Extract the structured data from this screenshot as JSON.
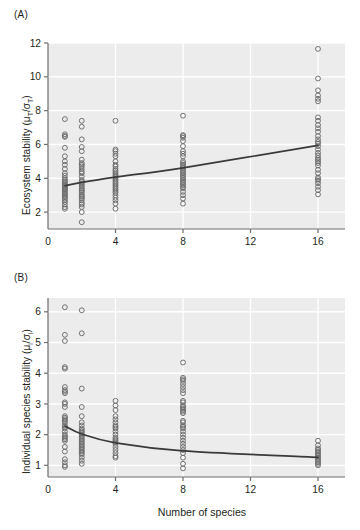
{
  "figure": {
    "width": 360,
    "height": 530,
    "background": "#ffffff",
    "plot_background": "#ececec",
    "gridline_color": "#ffffff",
    "axis_color": "#6e6e6e",
    "point_color": "#6b6b6b",
    "trend_color": "#3a3a3a"
  },
  "panels": {
    "a": {
      "label": "(A)",
      "ylabel_text": "Ecosystem stability (μT/σT)",
      "ylabel_main": "Ecosystem stability (μ",
      "ylabel_sub1": "T",
      "ylabel_mid": "/σ",
      "ylabel_sub2": "T",
      "ylabel_end": ")"
    },
    "b": {
      "label": "(B)",
      "ylabel_text": "Individual species stability (μi/σi)",
      "ylabel_main": "Individual species stability (μ",
      "ylabel_sub1": "i",
      "ylabel_mid": "/σ",
      "ylabel_sub2": "i",
      "ylabel_end": ")",
      "xlabel": "Number of species"
    }
  },
  "chart_data": [
    {
      "panel": "(A)",
      "type": "scatter",
      "title": "",
      "xlabel": "",
      "ylabel": "Ecosystem stability (μT/σT)",
      "xlim": [
        0,
        17.6
      ],
      "ylim": [
        1.0,
        12.0
      ],
      "xticks": [
        0,
        4,
        8,
        12,
        16
      ],
      "xticklabels": [
        "0",
        "4",
        "8",
        "12",
        "16"
      ],
      "yticks": [
        2,
        4,
        6,
        8,
        10,
        12
      ],
      "yticklabels": [
        "2",
        "4",
        "6",
        "8",
        "10",
        "12"
      ],
      "grid": true,
      "legend": "none",
      "series": [
        {
          "name": "observations",
          "marker": "open-circle",
          "x": [
            1,
            1,
            1,
            1,
            1,
            1,
            1,
            1,
            1,
            1,
            1,
            1,
            1,
            1,
            1,
            1,
            1,
            1,
            1,
            1,
            1,
            1,
            1,
            1,
            1,
            1,
            1,
            1,
            1,
            1,
            1,
            1,
            2,
            2,
            2,
            2,
            2,
            2,
            2,
            2,
            2,
            2,
            2,
            2,
            2,
            2,
            2,
            2,
            2,
            2,
            2,
            2,
            2,
            2,
            2,
            2,
            2,
            2,
            2,
            2,
            2,
            2,
            2,
            2,
            4,
            4,
            4,
            4,
            4,
            4,
            4,
            4,
            4,
            4,
            4,
            4,
            4,
            4,
            4,
            4,
            4,
            4,
            4,
            4,
            4,
            4,
            4,
            4,
            4,
            4,
            4,
            4,
            8,
            8,
            8,
            8,
            8,
            8,
            8,
            8,
            8,
            8,
            8,
            8,
            8,
            8,
            8,
            8,
            8,
            8,
            8,
            8,
            8,
            8,
            8,
            8,
            8,
            8,
            8,
            8,
            8,
            8,
            16,
            16,
            16,
            16,
            16,
            16,
            16,
            16,
            16,
            16,
            16,
            16,
            16,
            16,
            16,
            16,
            16,
            16,
            16,
            16,
            16,
            16,
            16,
            16,
            16,
            16,
            16,
            16,
            16,
            16,
            16,
            16,
            16
          ],
          "y": [
            7.5,
            6.6,
            6.5,
            6.45,
            5.8,
            5.3,
            5.0,
            4.8,
            4.55,
            4.3,
            4.15,
            4.0,
            3.9,
            3.8,
            3.7,
            3.62,
            3.55,
            3.5,
            3.42,
            3.35,
            3.3,
            3.2,
            3.12,
            3.05,
            2.95,
            2.9,
            2.8,
            2.7,
            2.6,
            2.45,
            2.3,
            2.2,
            7.4,
            7.05,
            6.3,
            5.85,
            5.6,
            5.1,
            4.9,
            4.8,
            4.7,
            4.55,
            4.4,
            4.3,
            4.1,
            3.9,
            3.8,
            3.7,
            3.6,
            3.5,
            3.4,
            3.3,
            3.25,
            3.15,
            3.05,
            2.95,
            2.9,
            2.8,
            2.7,
            2.55,
            2.45,
            2.3,
            2.0,
            1.4,
            7.4,
            5.7,
            5.6,
            5.45,
            5.3,
            5.0,
            4.8,
            4.7,
            4.55,
            4.45,
            4.35,
            4.25,
            4.15,
            4.05,
            3.95,
            3.85,
            3.75,
            3.65,
            3.55,
            3.45,
            3.35,
            3.25,
            3.15,
            3.0,
            2.85,
            2.7,
            2.5,
            2.2,
            7.7,
            6.55,
            6.5,
            6.4,
            6.2,
            5.9,
            5.6,
            5.45,
            5.3,
            5.0,
            4.9,
            4.8,
            4.7,
            4.6,
            4.5,
            4.4,
            4.3,
            4.2,
            4.1,
            4.0,
            3.9,
            3.8,
            3.7,
            3.6,
            3.5,
            3.4,
            3.2,
            3.0,
            2.8,
            2.5,
            11.65,
            9.9,
            9.2,
            8.9,
            8.7,
            8.55,
            7.6,
            7.4,
            7.15,
            6.95,
            6.75,
            6.5,
            6.3,
            6.15,
            6.05,
            5.9,
            5.7,
            5.5,
            5.35,
            5.2,
            5.1,
            5.0,
            4.9,
            4.75,
            4.5,
            4.3,
            4.05,
            3.95,
            3.85,
            3.7,
            3.5,
            3.3,
            3.05
          ]
        }
      ],
      "trend": {
        "name": "fitted-trend",
        "type": "line",
        "points": [
          [
            1,
            3.56
          ],
          [
            2,
            3.76
          ],
          [
            4,
            4.07
          ],
          [
            8,
            4.62
          ],
          [
            16,
            5.95
          ]
        ]
      }
    },
    {
      "panel": "(B)",
      "type": "scatter",
      "title": "",
      "xlabel": "Number of species",
      "ylabel": "Individual species stability (μi/σi)",
      "xlim": [
        0,
        17.6
      ],
      "ylim": [
        0.62,
        6.45
      ],
      "xticks": [
        0,
        4,
        8,
        12,
        16
      ],
      "xticklabels": [
        "0",
        "4",
        "8",
        "12",
        "16"
      ],
      "yticks": [
        1,
        2,
        3,
        4,
        5,
        6
      ],
      "yticklabels": [
        "1",
        "2",
        "3",
        "4",
        "5",
        "6"
      ],
      "grid": true,
      "legend": "none",
      "series": [
        {
          "name": "observations",
          "marker": "open-circle",
          "x": [
            1,
            1,
            1,
            1,
            1,
            1,
            1,
            1,
            1,
            1,
            1,
            1,
            1,
            1,
            1,
            1,
            1,
            1,
            1,
            1,
            1,
            1,
            1,
            1,
            1,
            1,
            1,
            1,
            1,
            1,
            1,
            1,
            2,
            2,
            2,
            2,
            2,
            2,
            2,
            2,
            2,
            2,
            2,
            2,
            2,
            2,
            2,
            2,
            2,
            2,
            2,
            2,
            2,
            2,
            2,
            2,
            2,
            2,
            2,
            2,
            4,
            4,
            4,
            4,
            4,
            4,
            4,
            4,
            4,
            4,
            4,
            4,
            4,
            4,
            4,
            4,
            4,
            4,
            4,
            4,
            4,
            8,
            8,
            8,
            8,
            8,
            8,
            8,
            8,
            8,
            8,
            8,
            8,
            8,
            8,
            8,
            8,
            8,
            8,
            8,
            8,
            8,
            8,
            8,
            8,
            8,
            8,
            8,
            8,
            8,
            8,
            8,
            8,
            16,
            16,
            16,
            16,
            16,
            16,
            16,
            16,
            16,
            16,
            16,
            16,
            16,
            16
          ],
          "y": [
            6.15,
            5.25,
            5.05,
            4.2,
            4.15,
            3.55,
            3.45,
            3.4,
            3.35,
            3.05,
            3.0,
            2.9,
            2.6,
            2.55,
            2.5,
            2.45,
            2.4,
            2.3,
            2.25,
            2.2,
            2.1,
            2.0,
            1.95,
            1.9,
            1.85,
            1.8,
            1.6,
            1.45,
            1.2,
            1.1,
            1.0,
            0.95,
            6.05,
            5.3,
            3.5,
            2.9,
            2.6,
            2.4,
            2.3,
            2.2,
            2.15,
            2.1,
            2.05,
            2.0,
            1.95,
            1.9,
            1.85,
            1.8,
            1.75,
            1.7,
            1.65,
            1.6,
            1.55,
            1.5,
            1.45,
            1.4,
            1.35,
            1.25,
            1.15,
            1.05,
            3.1,
            2.95,
            2.8,
            2.6,
            2.5,
            2.4,
            2.3,
            2.25,
            2.2,
            2.1,
            2.0,
            1.9,
            1.85,
            1.8,
            1.75,
            1.7,
            1.6,
            1.5,
            1.4,
            1.3,
            1.25,
            4.35,
            3.85,
            3.8,
            3.75,
            3.65,
            3.55,
            3.45,
            3.35,
            3.1,
            3.05,
            2.95,
            2.9,
            2.85,
            2.8,
            2.75,
            2.7,
            2.45,
            2.4,
            2.3,
            2.25,
            2.2,
            2.1,
            2.0,
            1.9,
            1.8,
            1.7,
            1.6,
            1.5,
            1.4,
            1.25,
            1.05,
            0.9,
            1.8,
            1.65,
            1.55,
            1.5,
            1.45,
            1.4,
            1.35,
            1.3,
            1.25,
            1.2,
            1.15,
            1.1,
            1.05,
            1.0
          ]
        }
      ],
      "trend": {
        "name": "fitted-trend",
        "type": "line",
        "points": [
          [
            1,
            2.28
          ],
          [
            2,
            2.02
          ],
          [
            4,
            1.73
          ],
          [
            8,
            1.47
          ],
          [
            16,
            1.26
          ]
        ]
      }
    }
  ]
}
